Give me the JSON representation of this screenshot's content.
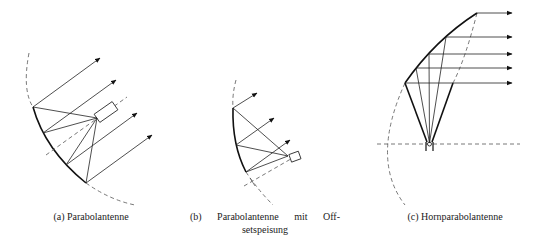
{
  "figure": {
    "panels": [
      {
        "id": "a",
        "label": "(a)",
        "caption": "(a) Parabolantenne",
        "title": "Parabolantenne",
        "elements": [
          "parabolic-reflector",
          "feed-horn",
          "rays",
          "axis"
        ]
      },
      {
        "id": "b",
        "label": "(b)",
        "caption_line1": "(b) Parabolantenne mit Off-",
        "caption_line2": "setspeisung",
        "title": "Parabolantenne mit Offsetspeisung",
        "elements": [
          "offset-parabolic-reflector",
          "feed-horn",
          "rays",
          "axis"
        ]
      },
      {
        "id": "c",
        "label": "(c)",
        "caption": "(c) Hornparabolantenne",
        "title": "Hornparabolantenne",
        "elements": [
          "horn-reflector",
          "feed",
          "rays",
          "axis"
        ]
      }
    ],
    "colors": {
      "line": "#222222",
      "dashed": "#555555",
      "background": "#ffffff"
    }
  }
}
